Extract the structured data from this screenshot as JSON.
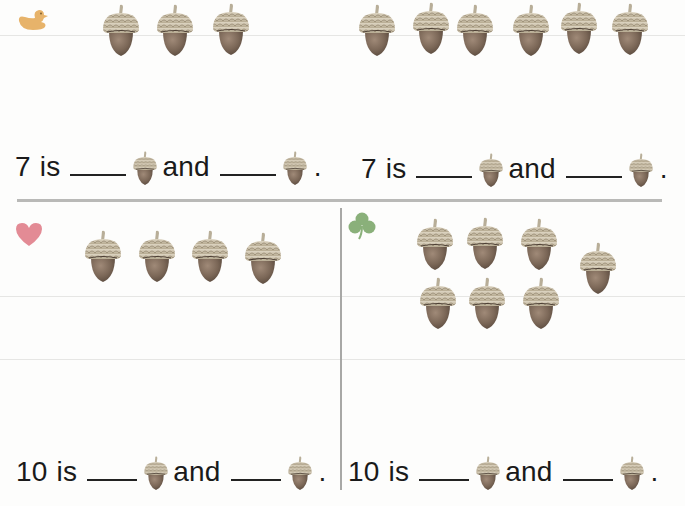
{
  "worksheet": {
    "colors": {
      "acorn_cap": "#c9bfa8",
      "acorn_nut": "#7a6655",
      "acorn_stem": "#b8ae98",
      "duck": "#e7b36a",
      "heart": "#e38b95",
      "clover": "#8ab07a",
      "divider": "#b9b9b7"
    },
    "problems": [
      {
        "id": "duck",
        "marker_icon": "duck-icon",
        "total": 7,
        "group_a_count": 3,
        "group_b_count": 6,
        "sentence": {
          "number": "7",
          "is": "is",
          "and": "and",
          "period": "."
        }
      },
      {
        "id": "heart",
        "marker_icon": "heart-icon",
        "total": 10,
        "group_a_count": 4,
        "sentence": {
          "number": "7",
          "is": "is",
          "and": "and",
          "period": "."
        }
      },
      {
        "id": "heart-sentence",
        "sentence": {
          "number": "10",
          "is": "is",
          "and": "and",
          "period": "."
        }
      },
      {
        "id": "clover",
        "marker_icon": "clover-icon",
        "total": 10,
        "group_a_count": 7,
        "sentence": {
          "number": "10",
          "is": "is",
          "and": "and",
          "period": "."
        }
      }
    ],
    "top_left_sentence": {
      "number": "7",
      "is": "is",
      "and": "and",
      "period": "."
    },
    "top_right_sentence": {
      "number": "7",
      "is": "is",
      "and": "and",
      "period": "."
    },
    "bottom_left_sentence": {
      "number": "10",
      "is": "is",
      "and": "and",
      "period": "."
    },
    "bottom_right_sentence": {
      "number": "10",
      "is": "is",
      "and": "and",
      "period": "."
    },
    "acorn_counts": {
      "top_left": 3,
      "top_right": 6,
      "bottom_left": 4,
      "bottom_right": 7
    }
  }
}
